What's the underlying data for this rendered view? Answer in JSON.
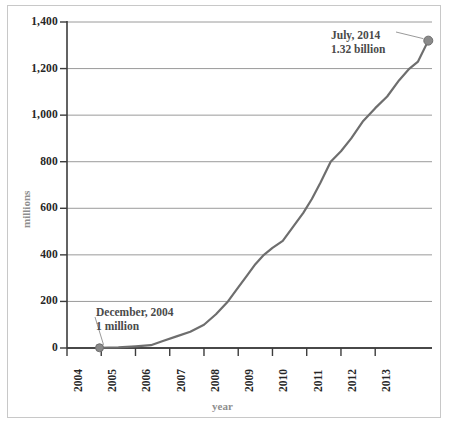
{
  "chart_data": {
    "type": "line",
    "title": "",
    "subtitle": "",
    "xlabel": "year",
    "ylabel": "millions",
    "xlim": [
      2004,
      2014.6
    ],
    "ylim": [
      0,
      1400
    ],
    "grid": true,
    "grid_axis": "y",
    "legend": "none",
    "line_color": "#6e6e6e",
    "marker_color": "#8a8a8a",
    "categories": [
      "2004",
      "2005",
      "2006",
      "2007",
      "2008",
      "2009",
      "2010",
      "2011",
      "2012",
      "2013"
    ],
    "x_tick_labels": [
      "2004",
      "2005",
      "2006",
      "2007",
      "2008",
      "2009",
      "2010",
      "2011",
      "2012",
      "2013"
    ],
    "y_tick_labels": [
      "0",
      "200",
      "400",
      "600",
      "800",
      "1,000",
      "1,200",
      "1,400"
    ],
    "y_tick_values": [
      0,
      200,
      400,
      600,
      800,
      1000,
      1200,
      1400
    ],
    "series": [
      {
        "name": "users",
        "units": "millions",
        "x": [
          2004.95,
          2005.5,
          2006.0,
          2006.45,
          2006.8,
          2007.2,
          2007.6,
          2008.0,
          2008.35,
          2008.7,
          2009.0,
          2009.25,
          2009.5,
          2009.75,
          2010.0,
          2010.3,
          2010.6,
          2010.9,
          2011.15,
          2011.4,
          2011.7,
          2012.0,
          2012.3,
          2012.65,
          2013.0,
          2013.35,
          2013.7,
          2014.0,
          2014.25,
          2014.55
        ],
        "values": [
          1,
          3,
          7,
          12,
          30,
          50,
          70,
          100,
          145,
          200,
          260,
          310,
          360,
          400,
          430,
          460,
          520,
          580,
          640,
          710,
          800,
          845,
          900,
          975,
          1030,
          1080,
          1150,
          1200,
          1230,
          1320
        ]
      }
    ],
    "annotations": [
      {
        "id": "start-annotation",
        "line1": "December, 2004",
        "line2": "1 million",
        "point_x": 2004.95,
        "point_y": 1,
        "label_x_px": 96,
        "label_y_px": 305
      },
      {
        "id": "end-annotation",
        "line1": "July, 2014",
        "line2": "1.32 billion",
        "point_x": 2014.55,
        "point_y": 1320,
        "label_x_px": 331,
        "label_y_px": 28
      }
    ],
    "markers": [
      {
        "id": "start-marker",
        "x": 2004.95,
        "y": 1
      },
      {
        "id": "end-marker",
        "x": 2014.55,
        "y": 1320
      }
    ]
  },
  "colors": {
    "line": "#6e6e6e",
    "marker": "#8a8a8a",
    "grid": "#8f8f8f",
    "axis": "#3c3c3c",
    "frame": "#c8c8c8",
    "tick_text": "#262626",
    "axis_title_text": "#8e8e8e",
    "annotation_text": "#4a4a4a"
  }
}
